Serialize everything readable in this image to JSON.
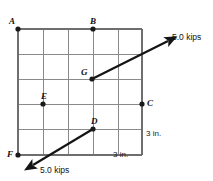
{
  "figure": {
    "background_color": "#ffffff",
    "ink_color": "#141414",
    "grid_color": "#8a8a8a"
  },
  "grid": {
    "columns": 5,
    "rows": 5,
    "cell_size_label": "3 in.",
    "left_px": 18,
    "top_px": 29,
    "right_px": 142,
    "bottom_px": 155,
    "cell_px": 25
  },
  "points": [
    {
      "id": "A",
      "label": "A",
      "x": 18,
      "y": 29,
      "label_dx": -9,
      "label_dy": -12
    },
    {
      "id": "B",
      "label": "B",
      "x": 93,
      "y": 29,
      "label_dx": -3,
      "label_dy": -12
    },
    {
      "id": "G",
      "label": "G",
      "x": 92,
      "y": 79,
      "label_dx": -11,
      "label_dy": -11
    },
    {
      "id": "E",
      "label": "E",
      "x": 43,
      "y": 104,
      "label_dx": -2,
      "label_dy": -12
    },
    {
      "id": "C",
      "label": "C",
      "x": 142,
      "y": 104,
      "label_dx": 5,
      "label_dy": -5
    },
    {
      "id": "D",
      "label": "D",
      "x": 93,
      "y": 129,
      "label_dx": -2,
      "label_dy": -12
    },
    {
      "id": "F",
      "label": "F",
      "x": 18,
      "y": 155,
      "label_dx": -11,
      "label_dy": -5
    }
  ],
  "forces": [
    {
      "id": "upper-force",
      "magnitude_label": "5.0 kips",
      "tail_x": 92,
      "tail_y": 79,
      "tip_x": 172,
      "tip_y": 38,
      "label_x": 176,
      "label_y": 30
    },
    {
      "id": "lower-force",
      "magnitude_label": "5.0 kips",
      "tail_x": 93,
      "tail_y": 129,
      "tip_x": 29,
      "tip_y": 168,
      "label_x": 40,
      "label_y": 168
    }
  ],
  "dimensions": [
    {
      "id": "vertical-dim",
      "label": "3 in.",
      "x": 146,
      "y": 132
    },
    {
      "id": "horizontal-dim",
      "label": "3 in.",
      "x": 112,
      "y": 152
    }
  ]
}
